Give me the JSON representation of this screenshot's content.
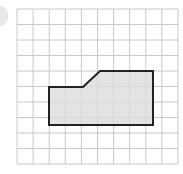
{
  "figure": {
    "type": "grid-shape",
    "grid": {
      "cols": 10,
      "rows": 10,
      "left": 17,
      "top": 9,
      "right": 178,
      "bottom": 164,
      "line_color": "#c8c8c8"
    },
    "shape": {
      "fill": "#dcdcdc",
      "stroke": "#222222",
      "points": [
        [
          49,
          87
        ],
        [
          83,
          87
        ],
        [
          100,
          71
        ],
        [
          153,
          71
        ],
        [
          153,
          125
        ],
        [
          49,
          125
        ]
      ]
    }
  }
}
